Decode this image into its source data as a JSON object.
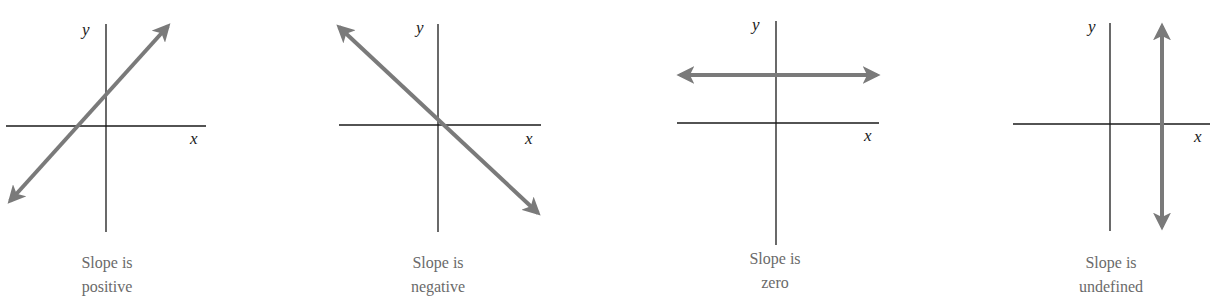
{
  "figure": {
    "colors": {
      "axis": "#1a1a1a",
      "line": "#7a7a7a",
      "caption": "#6a6a6a",
      "background": "#ffffff"
    },
    "panels": [
      {
        "id": "positive",
        "x_label": "x",
        "y_label": "y",
        "caption_line1": "Slope is",
        "caption_line2": "positive",
        "slope": "positive"
      },
      {
        "id": "negative",
        "x_label": "x",
        "y_label": "y",
        "caption_line1": "Slope is",
        "caption_line2": "negative",
        "slope": "negative"
      },
      {
        "id": "zero",
        "x_label": "x",
        "y_label": "y",
        "caption_line1": "Slope is",
        "caption_line2": "zero",
        "slope": "zero"
      },
      {
        "id": "undefined",
        "x_label": "x",
        "y_label": "y",
        "caption_line1": "Slope is",
        "caption_line2": "undefined",
        "slope": "undefined"
      }
    ]
  }
}
